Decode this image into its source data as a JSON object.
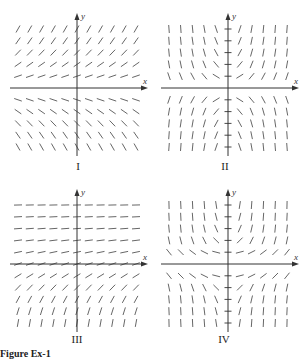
{
  "figure": {
    "caption": "Figure Ex-1",
    "axis_color": "#333333",
    "segment_color": "#555555"
  },
  "chart_data": [
    {
      "type": "slope_field",
      "label": "I",
      "xlabel": "x",
      "ylabel": "y",
      "grid": {
        "cols": [
          -5,
          -4,
          -3,
          -2,
          -1,
          0,
          1,
          2,
          3,
          4,
          5
        ],
        "rows": [
          5,
          4,
          3,
          2,
          1,
          -1,
          -2,
          -3,
          -4,
          -5
        ]
      },
      "slope_rule": "depends on y only: positive above x-axis, negative below; small near axis, steeper farther away",
      "y_axis_ticks": false
    },
    {
      "type": "slope_field",
      "label": "II",
      "xlabel": "x",
      "ylabel": "y",
      "grid": {
        "cols": [
          -5,
          -4,
          -3,
          -2,
          -1,
          0,
          1,
          2,
          3,
          4,
          5
        ],
        "rows": [
          5,
          4,
          3,
          2,
          1,
          -1,
          -2,
          -3,
          -4,
          -5
        ]
      },
      "slope_rule": "sign of x*y: upper-left negative, upper-right positive, lower-left positive, lower-right negative; near-vertical far from origin",
      "y_axis_ticks": true
    },
    {
      "type": "slope_field",
      "label": "III",
      "xlabel": "x",
      "ylabel": "y",
      "grid": {
        "cols": [
          -5,
          -4,
          -3,
          -2,
          -1,
          0,
          1,
          2,
          3,
          4,
          5
        ],
        "rows": [
          5,
          4,
          3,
          2,
          1,
          0,
          -1,
          -2,
          -3,
          -4,
          -5
        ]
      },
      "slope_rule": "depends on y only: nearly horizontal at top, increasing slope going down, near-vertical at bottom",
      "y_axis_ticks": false
    },
    {
      "type": "slope_field",
      "label": "IV",
      "xlabel": "x",
      "ylabel": "y",
      "grid": {
        "cols": [
          -5,
          -4,
          -3,
          -2,
          -1,
          0,
          1,
          2,
          3,
          4,
          5
        ],
        "rows": [
          5,
          4,
          3,
          2,
          1,
          -1,
          -2,
          -3,
          -4,
          -5
        ]
      },
      "slope_rule": "sign of x, magnitude grows with |y|: left side negative, right side positive in both halves",
      "y_axis_ticks": true
    }
  ]
}
